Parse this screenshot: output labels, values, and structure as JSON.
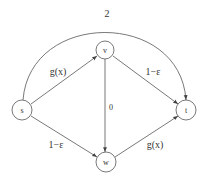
{
  "diagram": {
    "type": "directed-graph",
    "colors": {
      "stroke": "#555555",
      "text": "#333333",
      "background": "#ffffff"
    },
    "nodes": [
      {
        "id": "s",
        "label": "s",
        "x": 22,
        "y": 110,
        "r": 10
      },
      {
        "id": "v",
        "label": "v",
        "x": 105,
        "y": 50,
        "r": 9
      },
      {
        "id": "w",
        "label": "w",
        "x": 106,
        "y": 162,
        "r": 10
      },
      {
        "id": "t",
        "label": "t",
        "x": 186,
        "y": 110,
        "r": 10
      }
    ],
    "edges": [
      {
        "from": "s",
        "to": "t",
        "label": "2",
        "curved": true
      },
      {
        "from": "s",
        "to": "v",
        "label": "g(x)"
      },
      {
        "from": "v",
        "to": "t",
        "label": "1−ε"
      },
      {
        "from": "v",
        "to": "w",
        "label": "0"
      },
      {
        "from": "s",
        "to": "w",
        "label": "1−ε"
      },
      {
        "from": "w",
        "to": "t",
        "label": "g(x)"
      }
    ]
  }
}
